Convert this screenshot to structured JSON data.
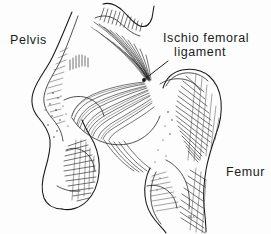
{
  "figure": {
    "style": "pen-and-ink line drawing",
    "background_color": "#fdfdfd",
    "ink_color": "#171717",
    "width": 271,
    "height": 234
  },
  "labels": {
    "pelvis": "Pelvis",
    "ligament_line1": "Ischio femoral",
    "ligament_line2": "ligament",
    "femur": "Femur"
  },
  "signature": {
    "text": "n.c."
  },
  "annotations": {
    "leader_line": {
      "from_x": 168,
      "from_y": 62,
      "to_x": 145,
      "to_y": 79,
      "marker": "dot"
    }
  },
  "structures": [
    {
      "name": "pelvis",
      "label": "Pelvis",
      "side": "left"
    },
    {
      "name": "ischiofemoral-ligament",
      "label": "Ischio femoral ligament",
      "side": "center"
    },
    {
      "name": "femur",
      "label": "Femur",
      "side": "right"
    },
    {
      "name": "greater-trochanter",
      "label": "",
      "side": "right"
    },
    {
      "name": "ischial-tuberosity",
      "label": "",
      "side": "left"
    }
  ]
}
